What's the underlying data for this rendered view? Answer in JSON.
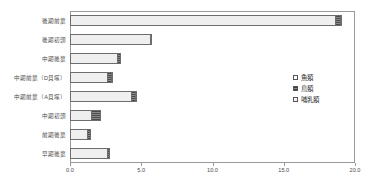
{
  "chart_data": {
    "type": "bar",
    "orientation": "horizontal",
    "stacked": true,
    "title": "",
    "xlabel": "",
    "ylabel": "",
    "xlim": [
      0.0,
      20.0
    ],
    "xticks": [
      "0.0",
      "5.0",
      "10.0",
      "15.0",
      "20.0"
    ],
    "xtick_values": [
      0.0,
      5.0,
      10.0,
      15.0,
      20.0
    ],
    "grid": false,
    "legend_position": "center-right",
    "categories": [
      "後期前葉",
      "後期初頭",
      "中期後葉",
      "中期前葉（D貝塚）",
      "中期前葉（A貝塚）",
      "中期初頭",
      "前期後葉",
      "早期後葉"
    ],
    "series": [
      {
        "name": "哺乳類",
        "values": [
          18.6,
          5.6,
          3.3,
          2.6,
          4.3,
          1.5,
          1.2,
          2.6
        ]
      },
      {
        "name": "鳥類",
        "values": [
          0.35,
          0.1,
          0.3,
          0.25,
          0.25,
          0.7,
          0.25,
          0.2
        ]
      },
      {
        "name": "魚類",
        "values": [
          0.1,
          0.0,
          0.0,
          0.1,
          0.05,
          0.0,
          0.0,
          0.0
        ]
      }
    ],
    "totals": [
      19.05,
      5.7,
      3.6,
      2.95,
      4.6,
      2.2,
      1.45,
      2.8
    ]
  },
  "legend": {
    "items": [
      {
        "label": "魚類",
        "swatch": "fish"
      },
      {
        "label": "鳥類",
        "swatch": "bird"
      },
      {
        "label": "哺乳類",
        "swatch": "mammal"
      }
    ]
  },
  "colors": {
    "frame": "#9a9a9a",
    "text": "#4a4a4a",
    "mammal": "#efefef",
    "bird": "#6a6a6a",
    "fish": "#ffffff"
  }
}
